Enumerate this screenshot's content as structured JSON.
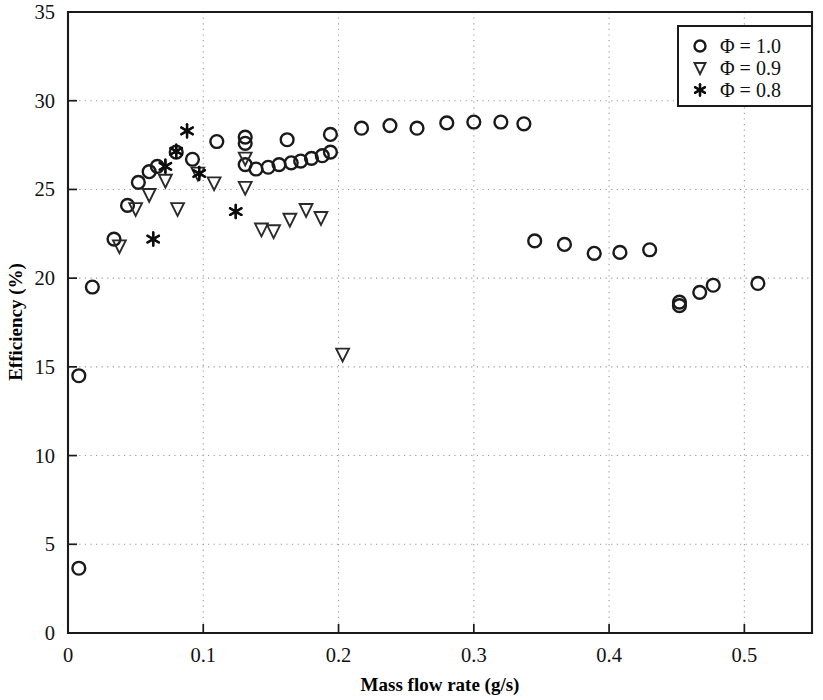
{
  "chart_data": {
    "type": "scatter",
    "title": "",
    "xlabel": "Mass flow rate (g/s)",
    "ylabel": "Efficiency (%)",
    "xlim": [
      0,
      0.55
    ],
    "ylim": [
      0,
      35
    ],
    "xticks": [
      0,
      0.1,
      0.2,
      0.3,
      0.4,
      0.5
    ],
    "xticklabels": [
      "0",
      "0.1",
      "0.2",
      "0.3",
      "0.4",
      "0.5"
    ],
    "yticks": [
      0,
      5,
      10,
      15,
      20,
      25,
      30,
      35
    ],
    "yticklabels": [
      "0",
      "5",
      "10",
      "15",
      "20",
      "25",
      "30",
      "35"
    ],
    "grid": true,
    "grid_style": "dotted",
    "legend_position": "top-right",
    "series": [
      {
        "name": "Φ = 1.0",
        "marker": "circle",
        "color": "#1a1a1a",
        "points": [
          [
            0.008,
            3.65
          ],
          [
            0.008,
            14.5
          ],
          [
            0.018,
            19.5
          ],
          [
            0.034,
            22.2
          ],
          [
            0.044,
            24.1
          ],
          [
            0.052,
            25.4
          ],
          [
            0.06,
            26.0
          ],
          [
            0.066,
            26.3
          ],
          [
            0.08,
            27.1
          ],
          [
            0.092,
            26.7
          ],
          [
            0.11,
            27.7
          ],
          [
            0.131,
            27.95
          ],
          [
            0.131,
            27.6
          ],
          [
            0.131,
            26.4
          ],
          [
            0.139,
            26.15
          ],
          [
            0.148,
            26.25
          ],
          [
            0.156,
            26.4
          ],
          [
            0.162,
            27.8
          ],
          [
            0.165,
            26.5
          ],
          [
            0.172,
            26.6
          ],
          [
            0.18,
            26.75
          ],
          [
            0.188,
            26.9
          ],
          [
            0.194,
            28.1
          ],
          [
            0.194,
            27.1
          ],
          [
            0.217,
            28.45
          ],
          [
            0.238,
            28.6
          ],
          [
            0.258,
            28.45
          ],
          [
            0.28,
            28.75
          ],
          [
            0.3,
            28.8
          ],
          [
            0.32,
            28.8
          ],
          [
            0.337,
            28.7
          ],
          [
            0.345,
            22.1
          ],
          [
            0.367,
            21.9
          ],
          [
            0.389,
            21.4
          ],
          [
            0.408,
            21.45
          ],
          [
            0.43,
            21.6
          ],
          [
            0.452,
            18.65
          ],
          [
            0.452,
            18.45
          ],
          [
            0.467,
            19.2
          ],
          [
            0.477,
            19.6
          ],
          [
            0.51,
            19.7
          ]
        ]
      },
      {
        "name": "Φ = 0.9",
        "marker": "triangle-down",
        "color": "#2a2a2a",
        "points": [
          [
            0.038,
            21.8
          ],
          [
            0.05,
            23.9
          ],
          [
            0.06,
            24.7
          ],
          [
            0.072,
            25.5
          ],
          [
            0.081,
            23.9
          ],
          [
            0.096,
            25.9
          ],
          [
            0.108,
            25.35
          ],
          [
            0.131,
            26.75
          ],
          [
            0.131,
            25.1
          ],
          [
            0.143,
            22.75
          ],
          [
            0.152,
            22.65
          ],
          [
            0.164,
            23.3
          ],
          [
            0.176,
            23.85
          ],
          [
            0.187,
            23.4
          ],
          [
            0.203,
            15.7
          ]
        ]
      },
      {
        "name": "Φ = 0.8",
        "marker": "asterisk",
        "color": "#0d0d0d",
        "points": [
          [
            0.063,
            22.2
          ],
          [
            0.072,
            26.3
          ],
          [
            0.08,
            27.15
          ],
          [
            0.088,
            28.3
          ],
          [
            0.097,
            25.9
          ],
          [
            0.124,
            23.75
          ]
        ]
      }
    ]
  },
  "legend": {
    "entries": [
      {
        "label": "Φ = 1.0",
        "marker": "circle"
      },
      {
        "label": "Φ = 0.9",
        "marker": "triangle-down"
      },
      {
        "label": "Φ = 0.8",
        "marker": "asterisk"
      }
    ]
  }
}
